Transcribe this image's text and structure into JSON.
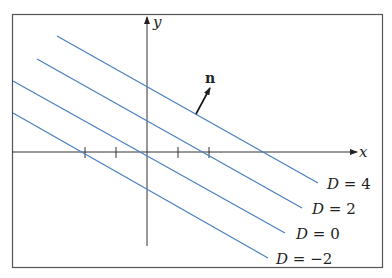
{
  "diagram": {
    "title": "",
    "axes": {
      "x_label": "x",
      "y_label": "y",
      "origin_px": [
        147,
        152
      ],
      "tick_spacing_px": 31,
      "x_ticks_px": [
        85,
        116,
        147,
        178,
        209
      ]
    },
    "normal_vector": {
      "label": "n",
      "from_px": [
        196,
        114
      ],
      "to_px": [
        211,
        87
      ]
    },
    "lines": [
      {
        "label": "D = 4",
        "D": "4",
        "from_px": [
          57,
          36
        ],
        "to_px": [
          318,
          183
        ],
        "label_px": [
          328,
          188
        ]
      },
      {
        "label": "D = 2",
        "D": "2",
        "from_px": [
          37,
          59
        ],
        "to_px": [
          302,
          208
        ],
        "label_px": [
          313,
          213
        ]
      },
      {
        "label": "D = 0",
        "D": "0",
        "from_px": [
          19,
          81
        ],
        "to_px": [
          285,
          233
        ],
        "label_px": [
          297,
          238
        ]
      },
      {
        "label": "D = −2",
        "D": "−2",
        "from_px": [
          12,
          113
        ],
        "to_px": [
          268,
          258
        ],
        "label_px": [
          276,
          263
        ]
      }
    ],
    "colors": {
      "line": "#4a7fc1",
      "axis": "#333333",
      "frame": "#555555"
    }
  }
}
